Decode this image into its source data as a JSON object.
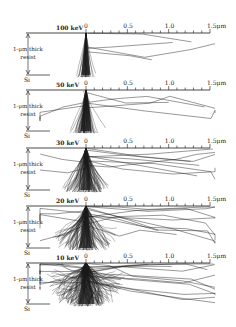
{
  "figure": {
    "axis": {
      "tick_labels": [
        "0",
        "0.5",
        "1.0",
        "1.5μm"
      ],
      "unit": "μm",
      "range": [
        0,
        1.5
      ],
      "minor_ticks_per_major": 5
    },
    "layer_labels": {
      "resist": [
        "1-μm thick",
        "resist"
      ],
      "substrate": "Si"
    },
    "panels": [
      {
        "energy": "100 keV",
        "axis_y": 33,
        "bottom_y": 75,
        "spread": 0.12,
        "density": 40,
        "long_tracks": 4
      },
      {
        "energy": "50 keV",
        "axis_y": 90,
        "bottom_y": 131,
        "spread": 0.28,
        "density": 70,
        "long_tracks": 6
      },
      {
        "energy": "30 keV",
        "axis_y": 148,
        "bottom_y": 190,
        "spread": 0.45,
        "density": 90,
        "long_tracks": 10
      },
      {
        "energy": "20 keV",
        "axis_y": 206,
        "bottom_y": 248,
        "spread": 0.75,
        "density": 110,
        "long_tracks": 14
      },
      {
        "energy": "10 keV",
        "axis_y": 263,
        "bottom_y": 304,
        "spread": 1.2,
        "density": 160,
        "long_tracks": 18
      }
    ],
    "colors": {
      "ink": "#1a1a1a",
      "background": "#ffffff"
    }
  }
}
